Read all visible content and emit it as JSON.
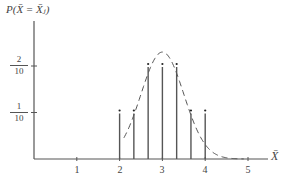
{
  "chart_data": {
    "type": "bar",
    "subtype": "stem",
    "title": "",
    "xlabel": "X̄",
    "ylabel": "P(X̄ = X̄ⱼ)",
    "x": [
      2.0,
      2.333,
      2.667,
      3.0,
      3.333,
      3.667,
      4.0
    ],
    "values": [
      0.1,
      0.1,
      0.2,
      0.2,
      0.2,
      0.1,
      0.1
    ],
    "xticks": [
      "1",
      "2",
      "3",
      "4",
      "5"
    ],
    "yticks": [
      {
        "value": 0.1,
        "num": "1",
        "den": "10"
      },
      {
        "value": 0.2,
        "num": "2",
        "den": "10"
      }
    ],
    "xlim": [
      0,
      5.5
    ],
    "ylim": [
      0,
      0.28
    ],
    "grid": false,
    "legend": null,
    "annotations": [
      "dashed normal-approximation curve centered at 3"
    ]
  },
  "labels": {
    "y_axis": "P(X̄ = X̄ⱼ)",
    "x_axis": "X̄",
    "x_ticks": [
      "1",
      "2",
      "3",
      "4",
      "5"
    ],
    "y_tick_1": {
      "num": "1",
      "den": "10"
    },
    "y_tick_2": {
      "num": "2",
      "den": "10"
    }
  }
}
